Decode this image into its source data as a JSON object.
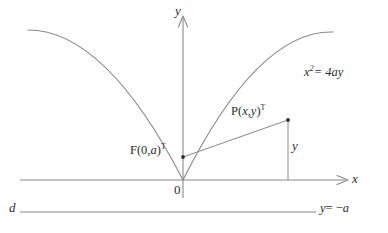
{
  "figure": {
    "kind": "geometry-diagram",
    "background_color": "#ffffff",
    "stroke_color": "#8a8a8a",
    "text_color": "#2e2e2e",
    "width": 388,
    "height": 233
  },
  "axes": {
    "x_label": "x",
    "y_label": "y",
    "origin_label": "0",
    "origin_px": {
      "x": 183,
      "y": 180
    },
    "x_axis_y_px": 180,
    "y_axis_x_px": 183
  },
  "curve": {
    "equation_label_prefix": "x",
    "equation_label_exponent": "2",
    "equation_label_suffix": "= 4ay",
    "equation_plain": "x^2 = 4ay",
    "vertex_px": {
      "x": 183,
      "y": 180
    },
    "left_end_px": {
      "x": 28,
      "y": 30
    },
    "right_end_px": {
      "x": 333,
      "y": 32
    },
    "coefficient": 0.00625
  },
  "points": {
    "focus": {
      "label_main": "F(0,",
      "label_param": "a",
      "label_close": ")",
      "label_sup": "T",
      "label_plain": "F(0,a)^T",
      "px": {
        "x": 183,
        "y": 157
      }
    },
    "point_p": {
      "label_main": "P(",
      "label_x": "x",
      "label_comma": ",",
      "label_y": "y",
      "label_close": ")",
      "label_sup": "T",
      "label_plain": "P(x,y)^T",
      "px": {
        "x": 288,
        "y": 120
      }
    }
  },
  "segments": {
    "focal_radius": {
      "from": "F",
      "to": "P"
    },
    "vertical_drop": {
      "label": "y",
      "from_px": {
        "x": 288,
        "y": 120
      },
      "to_px": {
        "x": 288,
        "y": 180
      }
    }
  },
  "directrix": {
    "name_label": "d",
    "equation_label_prefix": "y",
    "equation_label_suffix": "= −",
    "equation_label_param": "a",
    "equation_plain": "y = -a",
    "y_px": 212,
    "x_start_px": 20,
    "x_end_px": 316
  }
}
